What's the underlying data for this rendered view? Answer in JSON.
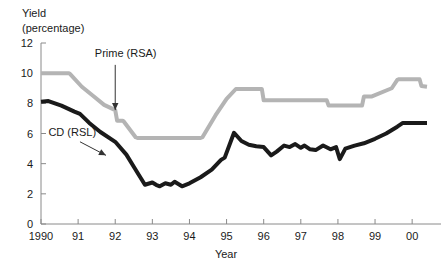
{
  "chart_data": {
    "type": "line",
    "title": "",
    "subtitle": "",
    "ylabel_line1": "Yield",
    "ylabel_line2": "(percentage)",
    "xlabel": "Year",
    "grid": false,
    "legend_position": "inline-annotations",
    "xlim": [
      1990,
      2000.4
    ],
    "ylim": [
      0,
      12
    ],
    "y_ticks": [
      0,
      2,
      4,
      6,
      8,
      10,
      12
    ],
    "y_tick_labels": [
      "0",
      "2",
      "4",
      "6",
      "8",
      "10",
      "12"
    ],
    "x_ticks": [
      1990,
      1991,
      1992,
      1993,
      1994,
      1995,
      1996,
      1997,
      1998,
      1999,
      2000
    ],
    "x_tick_labels": [
      "1990",
      "91",
      "92",
      "93",
      "94",
      "95",
      "96",
      "97",
      "98",
      "99",
      "00"
    ],
    "annotations": [
      {
        "name": "prime-rsa-annotation",
        "label": "Prime (RSA)",
        "label_x": 1991.45,
        "label_y": 11.05,
        "arrow_from_x": 1992.0,
        "arrow_from_y": 10.55,
        "arrow_to_x": 1992.0,
        "arrow_to_y": 7.55,
        "style": "vertical-down"
      },
      {
        "name": "cd-rsl-annotation",
        "label": "CD (RSL)",
        "label_x": 1990.2,
        "label_y": 5.85,
        "arrow_from_x": 1991.05,
        "arrow_from_y": 5.45,
        "arrow_to_x": 1991.75,
        "arrow_to_y": 4.55,
        "style": "diagonal-down-right"
      }
    ],
    "series": [
      {
        "name": "Prime (RSA)",
        "color": "#b4b4b4",
        "width": 4,
        "x": [
          1990.0,
          1990.75,
          1990.78,
          1991.1,
          1991.4,
          1991.7,
          1992.0,
          1992.05,
          1992.2,
          1992.23,
          1992.55,
          1992.6,
          1994.3,
          1994.35,
          1994.7,
          1995.0,
          1995.25,
          1995.3,
          1995.95,
          1996.0,
          1996.2,
          1996.25,
          1997.7,
          1997.75,
          1998.65,
          1998.7,
          1998.9,
          1998.95,
          1999.4,
          1999.45,
          1999.6,
          1999.65,
          2000.2,
          2000.25,
          2000.4
        ],
        "y": [
          10.0,
          10.0,
          9.95,
          9.1,
          8.5,
          7.9,
          7.55,
          6.85,
          6.85,
          6.8,
          5.75,
          5.7,
          5.7,
          5.75,
          7.2,
          8.3,
          8.95,
          8.95,
          8.95,
          8.2,
          8.2,
          8.2,
          8.2,
          7.85,
          7.85,
          8.45,
          8.45,
          8.5,
          8.95,
          9.0,
          9.55,
          9.6,
          9.6,
          9.15,
          9.1
        ],
        "y_by_year": {
          "1990": 10.0,
          "1991": 9.1,
          "1992": 7.55,
          "1993": 5.7,
          "1994": 5.7,
          "1995": 8.3,
          "1996": 8.2,
          "1997": 8.2,
          "1998": 7.85,
          "1999": 8.95,
          "2000": 9.6
        }
      },
      {
        "name": "CD (RSL)",
        "color": "#1a1a1a",
        "width": 4,
        "x": [
          1990.0,
          1990.2,
          1990.55,
          1990.9,
          1991.05,
          1991.3,
          1991.6,
          1992.0,
          1992.3,
          1992.5,
          1992.7,
          1992.8,
          1993.0,
          1993.1,
          1993.2,
          1993.35,
          1993.5,
          1993.6,
          1993.8,
          1994.0,
          1994.3,
          1994.6,
          1994.85,
          1994.95,
          1995.2,
          1995.4,
          1995.6,
          1995.8,
          1996.0,
          1996.2,
          1996.35,
          1996.55,
          1996.7,
          1996.85,
          1997.0,
          1997.1,
          1997.25,
          1997.4,
          1997.6,
          1997.8,
          1997.95,
          1998.05,
          1998.2,
          1998.45,
          1998.7,
          1999.0,
          1999.3,
          1999.6,
          1999.75,
          2000.0,
          2000.4
        ],
        "y": [
          8.1,
          8.15,
          7.85,
          7.45,
          7.3,
          6.7,
          6.1,
          5.45,
          4.6,
          3.8,
          3.0,
          2.6,
          2.75,
          2.6,
          2.5,
          2.7,
          2.6,
          2.8,
          2.5,
          2.7,
          3.1,
          3.6,
          4.25,
          4.4,
          6.05,
          5.5,
          5.25,
          5.15,
          5.1,
          4.55,
          4.8,
          5.2,
          5.1,
          5.3,
          5.05,
          5.2,
          4.95,
          4.9,
          5.2,
          4.95,
          5.1,
          4.3,
          5.0,
          5.2,
          5.35,
          5.65,
          6.0,
          6.45,
          6.7,
          6.7,
          6.7
        ],
        "y_by_year": {
          "1990": 8.1,
          "1991": 7.3,
          "1992": 5.45,
          "1993": 2.75,
          "1994": 2.7,
          "1995": 4.4,
          "1996": 5.1,
          "1997": 5.05,
          "1998": 4.3,
          "1999": 5.65,
          "2000": 6.7
        }
      }
    ]
  },
  "colors": {
    "prime_rsa": "#b4b4b4",
    "cd_rsl": "#1a1a1a",
    "axis": "#8a8a8a",
    "text": "#1a1a1a",
    "background": "#ffffff"
  }
}
